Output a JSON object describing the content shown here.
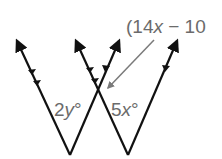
{
  "diagram": {
    "labels": {
      "angle_left": {
        "coef": "2",
        "var": "y",
        "unit": "°"
      },
      "angle_right": {
        "coef": "5",
        "var": "x",
        "unit": "°"
      },
      "angle_callout": {
        "open": "(14",
        "var": "x",
        "rest": " − 10"
      }
    },
    "colors": {
      "lines": "#111111",
      "labels": "#6b6b6b",
      "callout_arrow": "#7a7a7a"
    },
    "lines": [
      {
        "from": [
          70,
          155
        ],
        "to": [
          17,
          41
        ],
        "ticks": 2
      },
      {
        "from": [
          70,
          155
        ],
        "to": [
          119,
          41
        ],
        "ticks": 1
      },
      {
        "from": [
          128,
          155
        ],
        "to": [
          76,
          41
        ],
        "ticks": 2
      },
      {
        "from": [
          128,
          155
        ],
        "to": [
          177,
          41
        ],
        "ticks": 1
      }
    ]
  }
}
